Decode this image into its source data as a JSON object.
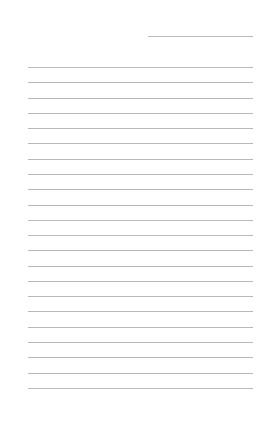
{
  "page": {
    "type": "lined-paper",
    "background_color": "#ffffff",
    "line_color": "#b9b9b9",
    "header_line": {
      "present": true,
      "label": ""
    },
    "writing_lines": {
      "count": 22,
      "first_line_y": 67,
      "spacing_px": 15.28
    }
  }
}
